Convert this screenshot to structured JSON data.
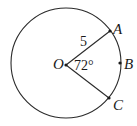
{
  "diagram": {
    "type": "circle-sector",
    "center": {
      "label": "O",
      "x": 66,
      "y": 65
    },
    "radius_px": 55,
    "circle_center": {
      "x": 66,
      "y": 63
    },
    "points": [
      {
        "label": "A",
        "x": 110,
        "y": 31
      },
      {
        "label": "B",
        "x": 120,
        "y": 63
      },
      {
        "label": "C",
        "x": 109,
        "y": 98
      }
    ],
    "radius_label": "5",
    "angle_label": "72°",
    "colors": {
      "stroke": "#2a2a2a",
      "background": "#ffffff"
    }
  },
  "labels": {
    "O": "O",
    "A": "A",
    "B": "B",
    "C": "C",
    "radius": "5",
    "angle": "72°"
  }
}
